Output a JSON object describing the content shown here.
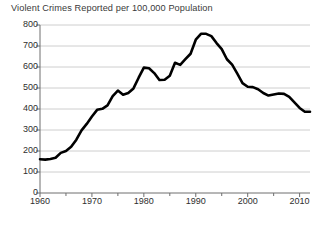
{
  "chart_data": {
    "type": "line",
    "title": "Violent Crimes Reported per 100,000 Population",
    "xlabel": "",
    "ylabel": "",
    "xlim": [
      1960,
      2012
    ],
    "ylim": [
      0,
      800
    ],
    "grid": true,
    "legend": "none",
    "line_color": "#000000",
    "grid_color": "#c8c8c8",
    "axis_color": "#6e6e6e",
    "y_ticks": [
      0,
      100,
      200,
      300,
      400,
      500,
      600,
      700,
      800
    ],
    "y_tick_labels": [
      "0",
      "100",
      "200",
      "300",
      "400",
      "500",
      "600",
      "700",
      "800"
    ],
    "x_ticks_major": [
      1960,
      1970,
      1980,
      1990,
      2000,
      2010
    ],
    "x_tick_labels": [
      "1960",
      "1970",
      "1980",
      "1990",
      "2000",
      "2010"
    ],
    "x_ticks_minor": [
      1965,
      1975,
      1985,
      1995,
      2005
    ],
    "series": [
      {
        "name": "Violent crime rate",
        "x": [
          1960,
          1961,
          1962,
          1963,
          1964,
          1965,
          1966,
          1967,
          1968,
          1969,
          1970,
          1971,
          1972,
          1973,
          1974,
          1975,
          1976,
          1977,
          1978,
          1979,
          1980,
          1981,
          1982,
          1983,
          1984,
          1985,
          1986,
          1987,
          1988,
          1989,
          1990,
          1991,
          1992,
          1993,
          1994,
          1995,
          1996,
          1997,
          1998,
          1999,
          2000,
          2001,
          2002,
          2003,
          2004,
          2005,
          2006,
          2007,
          2008,
          2009,
          2010,
          2011,
          2012
        ],
        "values": [
          161,
          159,
          162,
          168,
          191,
          200,
          220,
          254,
          298,
          329,
          364,
          396,
          401,
          417,
          461,
          488,
          468,
          476,
          498,
          549,
          597,
          594,
          571,
          538,
          539,
          558,
          620,
          610,
          637,
          663,
          730,
          758,
          758,
          747,
          714,
          685,
          637,
          611,
          568,
          523,
          506,
          504,
          494,
          476,
          464,
          469,
          474,
          472,
          458,
          432,
          405,
          387,
          387
        ]
      }
    ]
  }
}
